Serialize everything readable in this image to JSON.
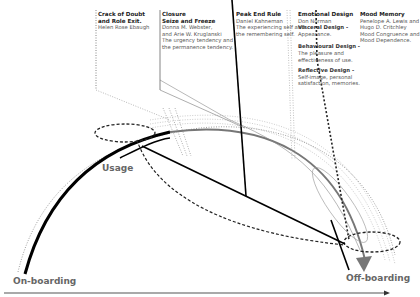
{
  "diagram": {
    "stages": {
      "onboarding": "On-boarding",
      "usage": "Usage",
      "offboarding": "Off-boarding"
    },
    "notes": [
      {
        "title": [
          "Crack of Doubt",
          "and Role Exit."
        ],
        "lines": [
          "Helen Rose Ebaugh"
        ]
      },
      {
        "title": [
          "Closure",
          "Seize and Freeze"
        ],
        "lines": [
          "Donna M. Webster,",
          "and Arie W. Kruglanski",
          "The urgency tendency and",
          "the permanence tendency."
        ]
      },
      {
        "title": [
          "Peak End Rule"
        ],
        "lines": [
          "Daniel Kahneman",
          "The experiencing self and",
          "the remembering self."
        ]
      },
      {
        "title": [
          "Emotional Design"
        ],
        "lines": [
          "Don Norman"
        ],
        "sections": [
          {
            "head": "Visceral Design -",
            "lines": [
              "Appearance."
            ]
          },
          {
            "head": "Behavioural Design -",
            "lines": [
              "The pleasure and",
              "effectiveness of use."
            ]
          },
          {
            "head": "Reflective Design -",
            "lines": [
              "Self-image, personal",
              "satisfaction, memories."
            ]
          }
        ]
      },
      {
        "title": [
          "Mood Memory"
        ],
        "lines": [
          "Penelope A. Lewis and",
          "Hugo D. Critchley",
          "Mood Congruence and",
          "Mood Dependence."
        ]
      }
    ]
  }
}
